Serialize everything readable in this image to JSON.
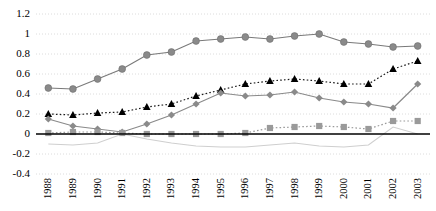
{
  "chart_data": {
    "type": "line",
    "title": "",
    "subtitle": "",
    "xlabel": "",
    "ylabel": "",
    "grid": true,
    "legend_position": "none",
    "zero_line": true,
    "categories": [
      "1988",
      "1989",
      "1990",
      "1991",
      "1992",
      "1993",
      "1994",
      "1995",
      "1996",
      "1997",
      "1998",
      "1999",
      "2000",
      "2001",
      "2002",
      "2003"
    ],
    "ylim": [
      -0.4,
      1.2
    ],
    "ytick_labels": [
      "1.2",
      "1",
      "0.8",
      "0.6",
      "0.4",
      "0.2",
      "0",
      "-0.2",
      "-0.4"
    ],
    "ytick_values": [
      1.2,
      1.0,
      0.8,
      0.6,
      0.4,
      0.2,
      0.0,
      -0.2,
      -0.4
    ],
    "series": [
      {
        "name": "series-circle",
        "marker": "circle",
        "line_style": "solid",
        "color": "#7a7a7a",
        "marker_color": "#8a8a8a",
        "values": [
          0.46,
          0.45,
          0.55,
          0.65,
          0.79,
          0.82,
          0.93,
          0.95,
          0.97,
          0.95,
          0.98,
          1.0,
          0.92,
          0.9,
          0.87,
          0.88
        ]
      },
      {
        "name": "series-triangle",
        "marker": "triangle",
        "line_style": "dotted",
        "color": "#1a1a1a",
        "marker_color": "#000000",
        "values": [
          0.2,
          0.19,
          0.21,
          0.22,
          0.27,
          0.3,
          0.38,
          0.44,
          0.5,
          0.53,
          0.55,
          0.53,
          0.5,
          0.5,
          0.65,
          0.73
        ]
      },
      {
        "name": "series-diamond",
        "marker": "diamond",
        "line_style": "solid",
        "color": "#8a8a8a",
        "marker_color": "#8a8a8a",
        "values": [
          0.15,
          0.08,
          0.05,
          0.02,
          0.1,
          0.19,
          0.3,
          0.41,
          0.38,
          0.39,
          0.42,
          0.36,
          0.32,
          0.3,
          0.26,
          0.5
        ]
      },
      {
        "name": "series-square",
        "marker": "square",
        "line_style": "dotted",
        "color": "#9a9a9a",
        "marker_color": "#9a9a9a",
        "values": [
          0.01,
          0.02,
          0.02,
          0.01,
          0.0,
          0.0,
          0.0,
          0.0,
          0.01,
          0.06,
          0.07,
          0.08,
          0.07,
          0.05,
          0.13,
          0.13
        ]
      },
      {
        "name": "series-light-line",
        "marker": "none",
        "line_style": "solid",
        "color": "#cfcfcf",
        "marker_color": "#cfcfcf",
        "values": [
          -0.1,
          -0.11,
          -0.09,
          0.0,
          -0.05,
          -0.09,
          -0.12,
          -0.13,
          -0.13,
          -0.11,
          -0.09,
          -0.12,
          -0.13,
          -0.11,
          0.07,
          0.0
        ]
      }
    ]
  }
}
